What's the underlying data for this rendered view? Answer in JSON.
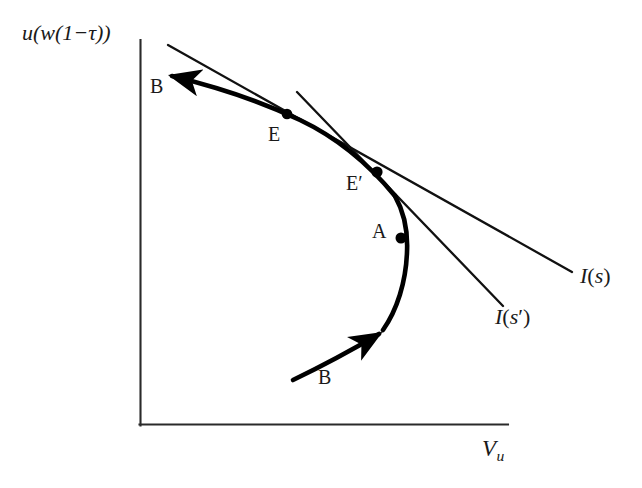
{
  "figure": {
    "type": "economics-diagram",
    "title_visible": false,
    "background_color": "#ffffff",
    "stroke_color": "#000000",
    "text_color": "#1a1a1a"
  },
  "axes": {
    "y_axis_label": "u(w(1−τ))",
    "y_axis_label_parts": {
      "u": "u",
      "open1": "(",
      "w": "w",
      "open2": "(",
      "one": "1",
      "minus": "−",
      "tau": "τ",
      "close2": ")",
      "close1": ")"
    },
    "x_axis_label": "V",
    "x_axis_label_subscript": "u",
    "x_axis_label_full": "V_u",
    "origin_px": [
      140,
      425
    ],
    "y_axis_top_px": [
      140,
      40
    ],
    "x_axis_right_px": [
      508,
      425
    ],
    "ticks": [],
    "grid": false
  },
  "curves": {
    "backward_bending": {
      "name": "B",
      "label_upper": "B",
      "label_lower": "B",
      "style": "thick",
      "arrow_upper": "arrow pointing up-left toward y-axis",
      "arrow_lower": "arrow pointing up-right toward point A"
    },
    "budget_lines": [
      {
        "name": "I(s)",
        "label_italic_letter": "I",
        "label_arg": "s",
        "label_prime": false,
        "style": "thin",
        "label_position_px": [
          582,
          277
        ]
      },
      {
        "name": "I(s′)",
        "label_italic_letter": "I",
        "label_arg": "s",
        "label_prime": true,
        "style": "thin",
        "label_position_px": [
          498,
          318
        ]
      }
    ]
  },
  "points": [
    {
      "label": "E",
      "prime": false,
      "dot_px": [
        287,
        114
      ],
      "label_px": [
        272,
        131
      ]
    },
    {
      "label": "E",
      "prime": true,
      "dot_px": [
        377,
        172
      ],
      "label_px": [
        349,
        180
      ]
    },
    {
      "label": "A",
      "prime": false,
      "dot_px": [
        401,
        238
      ],
      "label_px": [
        374,
        228
      ]
    }
  ],
  "branch_labels": [
    {
      "label": "B",
      "position_px": [
        152,
        83
      ],
      "branch": "upper"
    },
    {
      "label": "B",
      "position_px": [
        320,
        368
      ],
      "branch": "lower"
    }
  ]
}
